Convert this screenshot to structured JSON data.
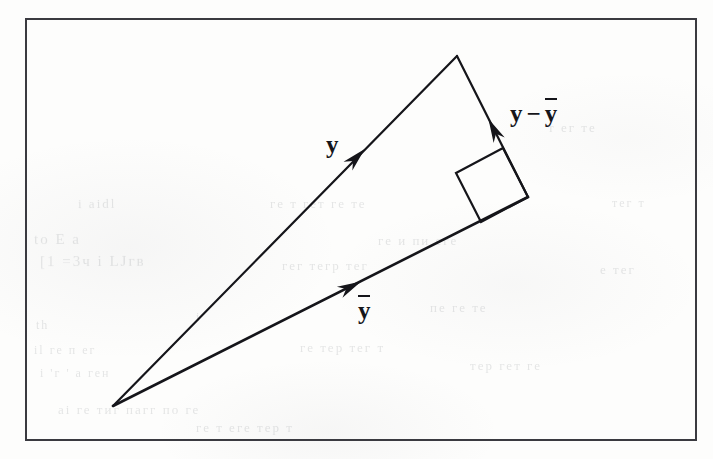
{
  "figure": {
    "kind": "vector-decomposition-diagram",
    "page_background": "#fdfdfc",
    "ink_color": "#15151a",
    "border_color": "#3a3a40"
  },
  "border": {
    "name": "figure-frame",
    "x": 25,
    "y": 18,
    "width": 672,
    "height": 423,
    "stroke_width": 2
  },
  "labels": {
    "y": {
      "text": "y",
      "x": 326,
      "y": 131
    },
    "ybar": {
      "glyph": "y",
      "has_overbar": true,
      "x": 358,
      "y": 297
    },
    "difference": {
      "lead": "y",
      "operator": "−",
      "trail": "y",
      "trail_has_overbar": true,
      "x": 510,
      "y": 100
    }
  },
  "ghost_text": [
    {
      "text": "i aidl",
      "x": 78,
      "y": 196,
      "size": 13,
      "rotate": -0.4
    },
    {
      "text": "to  E   a",
      "x": 34,
      "y": 231,
      "size": 15,
      "rotate": -0.3
    },
    {
      "text": "[1  =3ч  i LJгв",
      "x": 40,
      "y": 253,
      "size": 15,
      "rotate": -0.2
    },
    {
      "text": "i",
      "x": 196,
      "y": 310,
      "size": 12,
      "rotate": 0
    },
    {
      "text": "th",
      "x": 36,
      "y": 318,
      "size": 12,
      "rotate": 0
    },
    {
      "text": "il ге п ег",
      "x": 34,
      "y": 343,
      "size": 12,
      "rotate": 0
    },
    {
      "text": "i   'г '  а ген",
      "x": 40,
      "y": 366,
      "size": 12,
      "rotate": 0
    },
    {
      "text": "ai ге тиг пагг по ге",
      "x": 58,
      "y": 402,
      "size": 13,
      "rotate": 0
    },
    {
      "text": "ге т гет ге те",
      "x": 270,
      "y": 196,
      "size": 13,
      "rotate": 0
    },
    {
      "text": "ге и пи еге",
      "x": 378,
      "y": 233,
      "size": 13,
      "rotate": 0
    },
    {
      "text": "гег тегр тег",
      "x": 282,
      "y": 258,
      "size": 13,
      "rotate": 0
    },
    {
      "text": "пе ге те",
      "x": 430,
      "y": 300,
      "size": 13,
      "rotate": 0
    },
    {
      "text": "ге тер тег т",
      "x": 300,
      "y": 340,
      "size": 13,
      "rotate": 0
    },
    {
      "text": "тер гет ге",
      "x": 470,
      "y": 358,
      "size": 13,
      "rotate": 0
    },
    {
      "text": "ге т еге тер т",
      "x": 196,
      "y": 420,
      "size": 13,
      "rotate": 0
    },
    {
      "text": "т ег те",
      "x": 548,
      "y": 120,
      "size": 13,
      "rotate": 0
    },
    {
      "text": "е тег",
      "x": 600,
      "y": 262,
      "size": 13,
      "rotate": 0
    },
    {
      "text": "тег т",
      "x": 612,
      "y": 196,
      "size": 12,
      "rotate": 0
    }
  ],
  "chart_data": {
    "type": "diagram",
    "title": "",
    "vertices": {
      "origin": {
        "name": "origin",
        "x": 113,
        "y": 406
      },
      "apex": {
        "name": "y-tip",
        "x": 457,
        "y": 56
      },
      "foot": {
        "name": "ybar-tip",
        "x": 528,
        "y": 197
      }
    },
    "vectors": [
      {
        "name": "y",
        "label": "y",
        "from": "origin",
        "to": "apex",
        "from_xy": [
          113,
          406
        ],
        "to_xy": [
          457,
          56
        ],
        "arrowhead_at": [
          356,
          158
        ],
        "arrowhead_angle_deg": -45.5,
        "stroke_width": 2.2
      },
      {
        "name": "ybar",
        "label": "ybar",
        "from": "origin",
        "to": "foot",
        "from_xy": [
          113,
          406
        ],
        "to_xy": [
          528,
          197
        ],
        "arrowhead_at": [
          350,
          287
        ],
        "arrowhead_angle_deg": -26.7,
        "stroke_width": 2.6
      },
      {
        "name": "y-minus-ybar",
        "label": "y - ybar",
        "from": "foot",
        "to": "apex",
        "from_xy": [
          528,
          197
        ],
        "to_xy": [
          457,
          56
        ],
        "arrowhead_at": [
          494,
          130
        ],
        "arrowhead_angle_deg": -116.7,
        "stroke_width": 2.2
      }
    ],
    "right_angle_marker": {
      "name": "right-angle-square",
      "at_vertex": "foot",
      "at_xy": [
        528,
        197
      ],
      "size": 47,
      "corners": [
        [
          528,
          197
        ],
        [
          503,
          148
        ],
        [
          456,
          173
        ],
        [
          481,
          222
        ]
      ]
    },
    "grid": false,
    "legend": null
  }
}
